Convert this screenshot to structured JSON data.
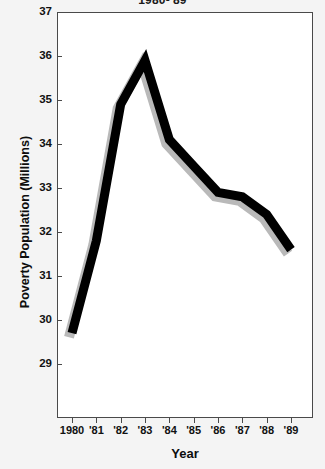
{
  "chart_data": {
    "type": "line",
    "title": "1980-'89",
    "xlabel": "Year",
    "ylabel": "Poverty Population (Millions)",
    "categories": [
      "1980",
      "'81",
      "'82",
      "'83",
      "'84",
      "'85",
      "'86",
      "'87",
      "'88",
      "'89"
    ],
    "x_tick_labels": [
      "1980",
      "'81",
      "'82",
      "'83",
      "'84",
      "'85",
      "'86",
      "'87",
      "'88",
      "'89"
    ],
    "y_tick_labels": [
      "37",
      "36",
      "35",
      "34",
      "33",
      "32",
      "31",
      "30",
      "29"
    ],
    "y_ticks": [
      37,
      36,
      35,
      34,
      33,
      32,
      31,
      30,
      29
    ],
    "ylim": [
      28.9,
      37.0
    ],
    "values": [
      29.7,
      31.8,
      34.9,
      35.9,
      34.1,
      33.5,
      32.9,
      32.8,
      32.4,
      31.6
    ],
    "series": [
      {
        "name": "Poverty Population",
        "values": [
          29.7,
          31.8,
          34.9,
          35.9,
          34.1,
          33.5,
          32.9,
          32.8,
          32.4,
          31.6
        ],
        "color": "#000000",
        "line_width": 9,
        "has_drop_shadow": true
      }
    ],
    "grid": false,
    "legend": "none",
    "markers": "none",
    "background_plot": "#ffffff",
    "background_figure": "#f4f4f4",
    "axis_color": "#4a4a4a"
  },
  "colors": {
    "line": "#000000",
    "shadow": "#b9b9b9",
    "text": "#111111",
    "frame": "#4a4a4a",
    "figure_bg": "#f4f4f4",
    "plot_bg": "#ffffff"
  }
}
